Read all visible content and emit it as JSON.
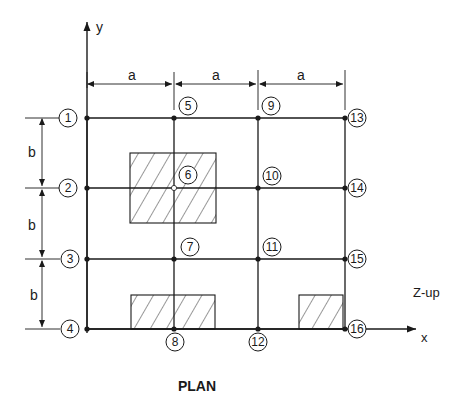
{
  "diagram": {
    "title": "PLAN",
    "axes": {
      "x_label": "x",
      "y_label": "y",
      "z_note": "Z-up"
    },
    "dimensions": {
      "horizontal": [
        "a",
        "a",
        "a"
      ],
      "vertical": [
        "b",
        "b",
        "b"
      ]
    },
    "grid": {
      "x": [
        87,
        174,
        258,
        345
      ],
      "y": [
        118,
        188,
        259,
        329
      ]
    },
    "nodes": [
      {
        "id": "1",
        "label": "1",
        "col": 0,
        "row": 0,
        "lx": 68,
        "ly": 118
      },
      {
        "id": "2",
        "label": "2",
        "col": 0,
        "row": 1,
        "lx": 68,
        "ly": 188
      },
      {
        "id": "3",
        "label": "3",
        "col": 0,
        "row": 2,
        "lx": 70,
        "ly": 259
      },
      {
        "id": "4",
        "label": "4",
        "col": 0,
        "row": 3,
        "lx": 70,
        "ly": 329
      },
      {
        "id": "5",
        "label": "5",
        "col": 1,
        "row": 0,
        "lx": 188,
        "ly": 106
      },
      {
        "id": "6",
        "label": "6",
        "col": 1,
        "row": 1,
        "lx": 188,
        "ly": 175
      },
      {
        "id": "7",
        "label": "7",
        "col": 1,
        "row": 2,
        "lx": 190,
        "ly": 247
      },
      {
        "id": "8",
        "label": "8",
        "col": 1,
        "row": 3,
        "lx": 175,
        "ly": 342
      },
      {
        "id": "9",
        "label": "9",
        "col": 2,
        "row": 0,
        "lx": 271,
        "ly": 106
      },
      {
        "id": "10",
        "label": "10",
        "col": 2,
        "row": 1,
        "lx": 272,
        "ly": 176
      },
      {
        "id": "11",
        "label": "11",
        "col": 2,
        "row": 2,
        "lx": 272,
        "ly": 247
      },
      {
        "id": "12",
        "label": "12",
        "col": 2,
        "row": 3,
        "lx": 258,
        "ly": 342
      },
      {
        "id": "13",
        "label": "13",
        "col": 3,
        "row": 0,
        "lx": 357,
        "ly": 118
      },
      {
        "id": "14",
        "label": "14",
        "col": 3,
        "row": 1,
        "lx": 357,
        "ly": 188
      },
      {
        "id": "15",
        "label": "15",
        "col": 3,
        "row": 2,
        "lx": 357,
        "ly": 259
      },
      {
        "id": "16",
        "label": "16",
        "col": 3,
        "row": 3,
        "lx": 357,
        "ly": 329
      }
    ],
    "hatched_regions": [
      {
        "name": "slab-hatch-center",
        "x": 130,
        "y": 153,
        "w": 86,
        "h": 70
      },
      {
        "name": "slab-hatch-bottom-left",
        "x": 131,
        "y": 295,
        "w": 84,
        "h": 34
      },
      {
        "name": "slab-hatch-bottom-right",
        "x": 299,
        "y": 295,
        "w": 44,
        "h": 34
      }
    ],
    "colors": {
      "line": "#1a1a1a",
      "background": "#ffffff"
    }
  }
}
